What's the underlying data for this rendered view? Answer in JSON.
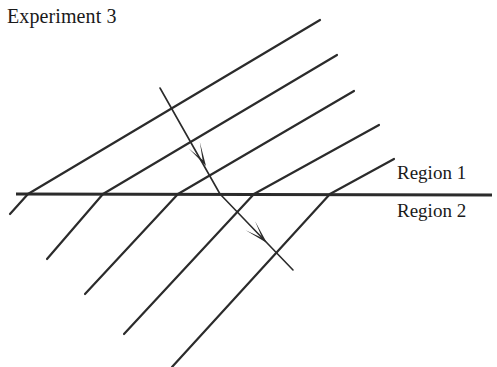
{
  "figure": {
    "title": "Experiment 3",
    "domain": "wave-refraction-diagram",
    "width": 497,
    "height": 367,
    "background_color": "#ffffff",
    "ink_color": "#2b2b2b",
    "labels": {
      "region_above": "Region 1",
      "region_below": "Region 2"
    }
  },
  "chart_data": {
    "type": "line",
    "title": "Experiment 3",
    "xlabel": "",
    "ylabel": "",
    "grid": false,
    "legend": "none",
    "xlim": [
      0,
      497
    ],
    "ylim": [
      367,
      0
    ],
    "annotations": [
      {
        "text": "Experiment 3",
        "x": 7,
        "y": 18
      },
      {
        "text": "Region 1",
        "x": 397,
        "y": 178
      },
      {
        "text": "Region 2",
        "x": 397,
        "y": 216
      }
    ],
    "series": [
      {
        "name": "interface",
        "stroke": "#2b2b2b",
        "width": 2.6,
        "x": [
          16,
          492
        ],
        "y": [
          194,
          195
        ]
      },
      {
        "name": "incident-wavefront-1",
        "stroke": "#2b2b2b",
        "width": 2.2,
        "x": [
          28,
          320
        ],
        "y": [
          194,
          20
        ]
      },
      {
        "name": "incident-wavefront-2",
        "stroke": "#2b2b2b",
        "width": 2.2,
        "x": [
          103,
          337
        ],
        "y": [
          194,
          55
        ]
      },
      {
        "name": "incident-wavefront-3",
        "stroke": "#2b2b2b",
        "width": 2.2,
        "x": [
          178,
          354
        ],
        "y": [
          194,
          91
        ]
      },
      {
        "name": "incident-wavefront-4",
        "stroke": "#2b2b2b",
        "width": 2.2,
        "x": [
          254,
          379
        ],
        "y": [
          194,
          125
        ]
      },
      {
        "name": "incident-wavefront-5",
        "stroke": "#2b2b2b",
        "width": 2.2,
        "x": [
          330,
          394
        ],
        "y": [
          194,
          159
        ]
      },
      {
        "name": "refracted-wavefront-1",
        "stroke": "#2b2b2b",
        "width": 2.2,
        "x": [
          28,
          10
        ],
        "y": [
          194,
          214
        ]
      },
      {
        "name": "refracted-wavefront-2",
        "stroke": "#2b2b2b",
        "width": 2.2,
        "x": [
          103,
          47
        ],
        "y": [
          194,
          259
        ]
      },
      {
        "name": "refracted-wavefront-3",
        "stroke": "#2b2b2b",
        "width": 2.2,
        "x": [
          178,
          85
        ],
        "y": [
          194,
          294
        ]
      },
      {
        "name": "refracted-wavefront-4",
        "stroke": "#2b2b2b",
        "width": 2.2,
        "x": [
          254,
          124
        ],
        "y": [
          194,
          334
        ]
      },
      {
        "name": "refracted-wavefront-5",
        "stroke": "#2b2b2b",
        "width": 2.2,
        "x": [
          330,
          172
        ],
        "y": [
          194,
          367
        ]
      },
      {
        "name": "incident-ray",
        "stroke": "#2b2b2b",
        "width": 1.6,
        "x": [
          160,
          220
        ],
        "y": [
          88,
          194
        ]
      },
      {
        "name": "refracted-ray",
        "stroke": "#2b2b2b",
        "width": 1.6,
        "x": [
          220,
          293
        ],
        "y": [
          194,
          270
        ]
      }
    ],
    "arrowheads": [
      {
        "name": "incident-ray-arrow",
        "tip_x": 206,
        "tip_y": 166,
        "angle_deg": 60.5
      },
      {
        "name": "refracted-ray-arrow",
        "tip_x": 267,
        "tip_y": 243,
        "angle_deg": 46.2
      }
    ]
  }
}
